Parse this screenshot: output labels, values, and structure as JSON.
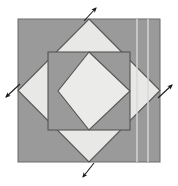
{
  "figure": {
    "width": 178,
    "height": 186,
    "background_color": "#ffffff",
    "colors": {
      "background": "#ffffff",
      "outer_square_fill": "#9a9a9a",
      "large_diamond_fill": "#e8e8e6",
      "inner_square_fill": "#9a9a9a",
      "inner_diamond_fill": "#ebebe9",
      "outline_stroke": "#555555",
      "fold_line": "#d9d9d7",
      "arrow_color": "#1a1a1a"
    },
    "outer_square": {
      "name": "outer-square",
      "x": 18,
      "y": 19,
      "width": 142,
      "height": 143,
      "fill": "#9a9a9a",
      "stroke": "#6a6a6a"
    },
    "large_diamond": {
      "name": "large-diamond",
      "points": "89,19 160,90.5 89,162 18,90.5",
      "fill": "#e8e8e6",
      "stroke": "#555555",
      "description": "diamond with vertices at the midpoints of the outer square edges"
    },
    "inner_square": {
      "name": "inner-square",
      "x": 48,
      "y": 52,
      "width": 82,
      "height": 78,
      "fill": "#9a9a9a",
      "stroke": "#555555"
    },
    "inner_diamond": {
      "name": "inner-diamond",
      "points": "89,52 130,91 89,130 58,91",
      "fill": "#ebebe9",
      "stroke": "#555555",
      "description": "diamond inscribed in the inner square"
    },
    "fold_lines": [
      {
        "name": "fold-line-left",
        "x": 137,
        "y1": 19,
        "y2": 162,
        "color": "#d9d9d7",
        "width": 1.4
      },
      {
        "name": "fold-line-right",
        "x": 148,
        "y1": 19,
        "y2": 162,
        "color": "#d9d9d7",
        "width": 1.4
      }
    ],
    "arrows": [
      {
        "name": "arrow-top",
        "direction": "up-right",
        "label": "",
        "tail_x": 84,
        "tail_y": 21,
        "head_x": 96,
        "head_y": 8
      },
      {
        "name": "arrow-right",
        "direction": "up-right",
        "label": "",
        "tail_x": 158,
        "tail_y": 98,
        "head_x": 172,
        "head_y": 85
      },
      {
        "name": "arrow-bottom",
        "direction": "down-left",
        "label": "",
        "tail_x": 94,
        "tail_y": 163,
        "head_x": 83,
        "head_y": 177
      },
      {
        "name": "arrow-left",
        "direction": "down-left",
        "label": "",
        "tail_x": 20,
        "tail_y": 84,
        "head_x": 6,
        "head_y": 97
      }
    ]
  }
}
